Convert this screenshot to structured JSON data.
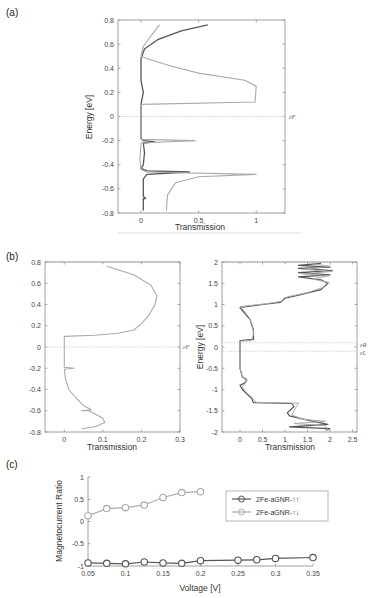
{
  "panels": {
    "a": {
      "label": "(a)"
    },
    "b": {
      "label": "(b)"
    },
    "c": {
      "label": "(c)"
    }
  },
  "colors": {
    "dark": "#555555",
    "light": "#aaaaaa",
    "axis": "#888888",
    "fermi": "#bbbbbb"
  },
  "chart_data": [
    {
      "id": "a",
      "type": "line",
      "title": "",
      "xlabel": "Transmission",
      "ylabel": "Energy [eV]",
      "xlim": [
        -0.2,
        1.25
      ],
      "ylim": [
        -0.8,
        0.8
      ],
      "xticks": [
        "0",
        "0.5",
        "1"
      ],
      "yticks": [
        "-0.8",
        "-0.6",
        "-0.4",
        "-0.2",
        "0",
        "0.2",
        "0.4",
        "0.6",
        "0.8"
      ],
      "annotations": [
        "εF"
      ],
      "fermi_level": 0,
      "series": [
        {
          "name": "dark",
          "points": [
            [
              0.02,
              -0.78
            ],
            [
              0.02,
              -0.68
            ],
            [
              0.04,
              -0.68
            ],
            [
              0.02,
              -0.66
            ],
            [
              0.02,
              -0.52
            ],
            [
              0.05,
              -0.48
            ],
            [
              0.42,
              -0.46
            ],
            [
              0.05,
              -0.45
            ],
            [
              0.0,
              -0.43
            ],
            [
              0.02,
              -0.4
            ],
            [
              0.03,
              -0.3
            ],
            [
              0.02,
              -0.22
            ],
            [
              0.12,
              -0.21
            ],
            [
              0.02,
              -0.2
            ],
            [
              0.0,
              -0.18
            ],
            [
              0.0,
              0.1
            ],
            [
              0.02,
              0.2
            ],
            [
              0.0,
              0.3
            ],
            [
              0.0,
              0.48
            ],
            [
              0.03,
              0.56
            ],
            [
              0.15,
              0.64
            ],
            [
              0.35,
              0.71
            ],
            [
              0.58,
              0.76
            ]
          ]
        },
        {
          "name": "light",
          "points": [
            [
              0.22,
              -0.78
            ],
            [
              0.23,
              -0.65
            ],
            [
              0.3,
              -0.55
            ],
            [
              0.5,
              -0.5
            ],
            [
              1.0,
              -0.48
            ],
            [
              0.05,
              -0.46
            ],
            [
              0.0,
              -0.44
            ],
            [
              -0.01,
              -0.35
            ],
            [
              0.0,
              -0.22
            ],
            [
              0.47,
              -0.2
            ],
            [
              0.0,
              -0.19
            ],
            [
              0.0,
              0.1
            ],
            [
              0.99,
              0.12
            ],
            [
              1.0,
              0.25
            ],
            [
              0.9,
              0.3
            ],
            [
              0.5,
              0.36
            ],
            [
              0.25,
              0.42
            ],
            [
              0.05,
              0.48
            ],
            [
              0.0,
              0.5
            ],
            [
              0.02,
              0.58
            ],
            [
              0.08,
              0.66
            ],
            [
              0.16,
              0.76
            ]
          ]
        }
      ]
    },
    {
      "id": "b-left",
      "type": "line",
      "title": "",
      "xlabel": "Transmission",
      "ylabel": "",
      "xlim": [
        -0.05,
        0.3
      ],
      "ylim": [
        -0.8,
        0.8
      ],
      "xticks": [
        "0",
        "0.1",
        "0.2",
        "0.3"
      ],
      "yticks": [
        "-0.8",
        "-0.6",
        "-0.4",
        "-0.2",
        "0",
        "0.2",
        "0.4",
        "0.6",
        "0.8"
      ],
      "annotations": [
        "εF"
      ],
      "fermi_level": 0,
      "series": [
        {
          "name": "light",
          "points": [
            [
              0.045,
              -0.77
            ],
            [
              0.08,
              -0.75
            ],
            [
              0.105,
              -0.71
            ],
            [
              0.1,
              -0.67
            ],
            [
              0.075,
              -0.62
            ],
            [
              0.065,
              -0.6
            ],
            [
              0.045,
              -0.6
            ],
            [
              0.07,
              -0.59
            ],
            [
              0.05,
              -0.55
            ],
            [
              0.03,
              -0.48
            ],
            [
              0.012,
              -0.4
            ],
            [
              0.003,
              -0.3
            ],
            [
              0.0,
              -0.21
            ],
            [
              0.025,
              -0.2
            ],
            [
              0.0,
              -0.19
            ],
            [
              0.0,
              0.1
            ],
            [
              0.08,
              0.11
            ],
            [
              0.14,
              0.13
            ],
            [
              0.18,
              0.16
            ],
            [
              0.2,
              0.22
            ],
            [
              0.22,
              0.3
            ],
            [
              0.235,
              0.4
            ],
            [
              0.24,
              0.48
            ],
            [
              0.225,
              0.58
            ],
            [
              0.18,
              0.68
            ],
            [
              0.11,
              0.76
            ]
          ]
        }
      ]
    },
    {
      "id": "b-right",
      "type": "line",
      "title": "",
      "xlabel": "Transmission",
      "ylabel": "Energy [eV]",
      "xlim": [
        -0.4,
        2.6
      ],
      "ylim": [
        -2,
        2
      ],
      "xticks": [
        "0",
        "0.5",
        "1",
        "1.5",
        "2",
        "2.5"
      ],
      "yticks": [
        "-2",
        "-1.5",
        "-1",
        "-0.5",
        "0",
        "0.5",
        "1",
        "1.5",
        "2"
      ],
      "annotations": [
        "εR",
        "εL"
      ],
      "fermi_levels": [
        0.1,
        -0.1
      ],
      "series": [
        {
          "name": "dark",
          "points": [
            [
              1.9,
              -1.95
            ],
            [
              2.0,
              -1.92
            ],
            [
              1.1,
              -1.88
            ],
            [
              1.95,
              -1.82
            ],
            [
              1.5,
              -1.72
            ],
            [
              1.1,
              -1.62
            ],
            [
              1.05,
              -1.55
            ],
            [
              1.2,
              -1.4
            ],
            [
              1.15,
              -1.33
            ],
            [
              0.3,
              -1.31
            ],
            [
              0.25,
              -1.2
            ],
            [
              0.05,
              -1.0
            ],
            [
              0.0,
              -0.9
            ],
            [
              0.1,
              -0.85
            ],
            [
              0.15,
              -0.78
            ],
            [
              0.05,
              -0.7
            ],
            [
              0.0,
              -0.5
            ],
            [
              0.0,
              0.15
            ],
            [
              0.3,
              0.18
            ],
            [
              0.3,
              0.4
            ],
            [
              0.22,
              0.65
            ],
            [
              0.1,
              0.8
            ],
            [
              0.0,
              0.93
            ],
            [
              0.5,
              1.0
            ],
            [
              0.9,
              1.05
            ],
            [
              1.0,
              1.15
            ],
            [
              1.3,
              1.22
            ],
            [
              1.8,
              1.35
            ],
            [
              1.95,
              1.5
            ],
            [
              1.8,
              1.58
            ],
            [
              1.3,
              1.65
            ],
            [
              2.0,
              1.7
            ],
            [
              1.3,
              1.75
            ],
            [
              2.05,
              1.8
            ],
            [
              1.3,
              1.85
            ],
            [
              2.0,
              1.88
            ],
            [
              1.3,
              1.92
            ],
            [
              1.8,
              1.97
            ]
          ]
        },
        {
          "name": "light",
          "points": [
            [
              1.95,
              -1.97
            ],
            [
              1.9,
              -1.85
            ],
            [
              1.2,
              -1.8
            ],
            [
              1.9,
              -1.75
            ],
            [
              1.4,
              -1.7
            ],
            [
              1.15,
              -1.6
            ],
            [
              1.25,
              -1.4
            ],
            [
              1.3,
              -1.32
            ],
            [
              0.35,
              -1.3
            ],
            [
              0.3,
              -1.22
            ],
            [
              0.12,
              -1.05
            ],
            [
              0.05,
              -0.93
            ],
            [
              0.12,
              -0.85
            ],
            [
              0.15,
              -0.75
            ],
            [
              0.05,
              -0.7
            ],
            [
              0.0,
              -0.5
            ],
            [
              0.0,
              0.14
            ],
            [
              0.25,
              0.15
            ],
            [
              0.3,
              0.3
            ],
            [
              0.28,
              0.5
            ],
            [
              0.2,
              0.7
            ],
            [
              0.05,
              0.9
            ],
            [
              0.0,
              0.95
            ],
            [
              0.6,
              1.02
            ],
            [
              0.95,
              1.08
            ],
            [
              1.05,
              1.18
            ],
            [
              1.5,
              1.28
            ],
            [
              1.9,
              1.42
            ],
            [
              1.98,
              1.52
            ],
            [
              1.6,
              1.6
            ],
            [
              2.0,
              1.68
            ],
            [
              1.4,
              1.72
            ],
            [
              2.05,
              1.78
            ],
            [
              1.4,
              1.83
            ],
            [
              2.0,
              1.9
            ],
            [
              1.6,
              1.96
            ]
          ]
        }
      ]
    },
    {
      "id": "c",
      "type": "line",
      "title": "",
      "xlabel": "Voltage [V]",
      "ylabel": "Magnetocurrent Ratio",
      "xlim": [
        0.05,
        0.35
      ],
      "ylim": [
        -1,
        1
      ],
      "xticks": [
        "0.05",
        "0.1",
        "0.15",
        "0.2",
        "0.25",
        "0.3",
        "0.35"
      ],
      "yticks": [
        "-1",
        "-0.5",
        "0",
        "0.5",
        "1"
      ],
      "legend_position": "upper right",
      "series": [
        {
          "name": "2Fe-aGNR-↑↑",
          "color": "dark",
          "x": [
            0.05,
            0.075,
            0.1,
            0.125,
            0.15,
            0.175,
            0.2,
            0.25,
            0.275,
            0.3,
            0.35
          ],
          "values": [
            -0.93,
            -0.94,
            -0.95,
            -0.91,
            -0.93,
            -0.94,
            -0.88,
            -0.87,
            -0.86,
            -0.83,
            -0.81
          ]
        },
        {
          "name": "2Fe-aGNR-↑↓",
          "color": "light",
          "x": [
            0.05,
            0.075,
            0.1,
            0.125,
            0.15,
            0.175,
            0.2
          ],
          "values": [
            0.13,
            0.29,
            0.31,
            0.37,
            0.54,
            0.65,
            0.67
          ]
        }
      ]
    }
  ]
}
